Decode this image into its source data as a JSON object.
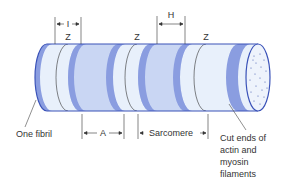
{
  "labels": {
    "z1": "Z",
    "z2": "Z",
    "z3": "Z",
    "i_band": "I",
    "h_zone": "H",
    "a_band": "A",
    "sarcomere": "Sarcomere",
    "one_fibril": "One fibril",
    "cut_ends_line1": "Cut ends of",
    "cut_ends_line2": "actin and",
    "cut_ends_line3": "myosin",
    "cut_ends_line4": "filaments"
  },
  "colors": {
    "outline": "#3a52b8",
    "light_band": "#e8f0fb",
    "dark_band": "#8a9de0",
    "mid_band": "#c9d6f3",
    "leader_line": "#444444"
  }
}
